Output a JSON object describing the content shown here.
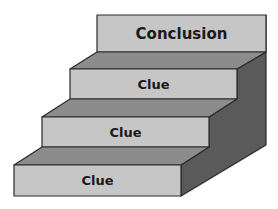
{
  "diagram": {
    "type": "staircase",
    "steps": [
      {
        "label": "Clue",
        "level": 1
      },
      {
        "label": "Clue",
        "level": 2
      },
      {
        "label": "Clue",
        "level": 3
      },
      {
        "label": "Conclusion",
        "level": 4
      }
    ]
  },
  "colors": {
    "front": "#c6c6c6",
    "top": "#8c8c8c",
    "side": "#5a5a5a",
    "outline": "#2a2a2a"
  }
}
